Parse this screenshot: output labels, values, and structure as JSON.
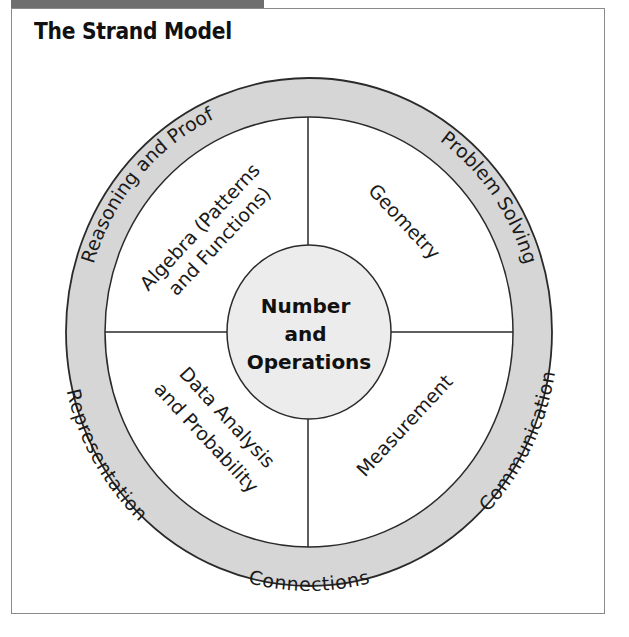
{
  "title": "The Strand Model",
  "colors": {
    "ring_fill": "#d6d6d6",
    "core_fill": "#ececec",
    "stroke": "#2a2a2a",
    "frame": "#8a8a8a",
    "header_tab": "#6e6e6e"
  },
  "core": {
    "lines": [
      "Number",
      "and",
      "Operations"
    ]
  },
  "content_strands": {
    "top_left": [
      "Algebra (Patterns",
      "and Functions)"
    ],
    "top_right": [
      "Geometry"
    ],
    "bottom_left": [
      "Data Analysis",
      "and Probability"
    ],
    "bottom_right": [
      "Measurement"
    ]
  },
  "process_strands": {
    "reasoning": "Reasoning and Proof",
    "problem_solving": "Problem Solving",
    "representation": "Representation",
    "connections": "Connections",
    "communication": "Communication"
  }
}
